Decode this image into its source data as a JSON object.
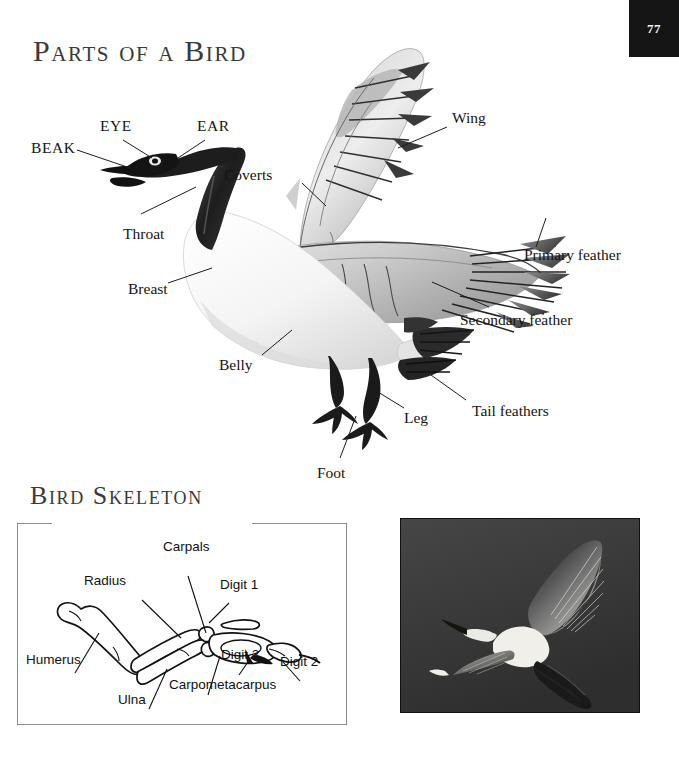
{
  "page": {
    "number": "77",
    "background_color": "#ffffff",
    "chip_color": "#151515"
  },
  "sections": {
    "parts_of_bird": {
      "title": "Parts of a Bird",
      "labels": [
        {
          "key": "beak",
          "text": "BEAK"
        },
        {
          "key": "eye",
          "text": "EYE"
        },
        {
          "key": "ear",
          "text": "EAR"
        },
        {
          "key": "coverts",
          "text": "Coverts"
        },
        {
          "key": "wing",
          "text": "Wing"
        },
        {
          "key": "throat",
          "text": "Throat"
        },
        {
          "key": "breast",
          "text": "Breast"
        },
        {
          "key": "belly",
          "text": "Belly"
        },
        {
          "key": "primary_feather",
          "text": "Primary feather"
        },
        {
          "key": "secondary_feather",
          "text": "Secondary feather"
        },
        {
          "key": "tail_feathers",
          "text": "Tail feathers"
        },
        {
          "key": "leg",
          "text": "Leg"
        },
        {
          "key": "foot",
          "text": "Foot"
        }
      ]
    },
    "bird_skeleton": {
      "title": "Bird Skeleton",
      "labels": [
        {
          "key": "carpals",
          "text": "Carpals"
        },
        {
          "key": "radius",
          "text": "Radius"
        },
        {
          "key": "digit_1",
          "text": "Digit 1"
        },
        {
          "key": "humerus",
          "text": "Humerus"
        },
        {
          "key": "digit_3",
          "text": "Digit 3"
        },
        {
          "key": "digit_2",
          "text": "Digit 2"
        },
        {
          "key": "ulna",
          "text": "Ulna"
        },
        {
          "key": "carpometacarpus",
          "text": "Carpometacarpus"
        }
      ]
    },
    "photo": {
      "subject": "egret-in-flight-photograph",
      "background_color": "#3a3a3a",
      "bird_color": "#f0efe9"
    }
  }
}
